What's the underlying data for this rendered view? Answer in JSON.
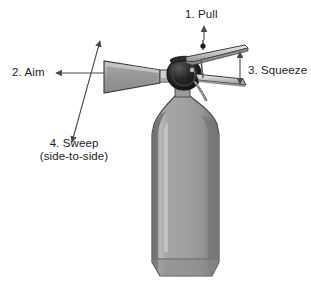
{
  "figure": {
    "background_color": "#ffffff"
  },
  "labels": [
    {
      "id": "pull",
      "text": "1. Pull",
      "arrow": "up-arrow-to-pin"
    },
    {
      "id": "aim",
      "text": "2. Aim",
      "arrow": "left-arrow-to-nozzle"
    },
    {
      "id": "squeeze",
      "text": "3. Squeeze",
      "arrow": "vertical-double-arrow-between-handles"
    },
    {
      "id": "sweep",
      "line1": "4. Sweep",
      "line2": "(side-to-side)",
      "arrow": "diagonal-double-arrow"
    }
  ],
  "colors": {
    "outline": "#2b2b2b",
    "arrow": "#4a4a4a",
    "cylinder_light": "#a9a9a9",
    "cylinder_mid": "#9a9a9a",
    "cylinder_dark": "#7d7d7d",
    "cylinder_edge_dark": "#6f6f6f",
    "highlight": "#c4c4c4",
    "valve_dark": "#1e1e1e",
    "metal_light": "#d8d8d8",
    "metal_mid": "#b0b0b0",
    "metal_dark": "#8a8a8a"
  },
  "parts": [
    {
      "name": "horn-nozzle",
      "description": "cone-shaped discharge horn pointing left"
    },
    {
      "name": "valve-body",
      "description": "dark round valve head at top of cylinder"
    },
    {
      "name": "upper-handle",
      "description": "upper carrying lever extending right"
    },
    {
      "name": "lower-handle",
      "description": "lower squeeze lever extending right"
    },
    {
      "name": "safety-pin",
      "description": "pull pin at top of valve"
    },
    {
      "name": "pin-chain",
      "description": "chain hanging from pin ring"
    },
    {
      "name": "cylinder-body",
      "description": "gray pressurized cylinder"
    }
  ]
}
